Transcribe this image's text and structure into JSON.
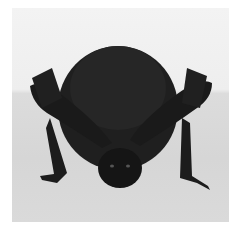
{
  "image": {
    "subject": "bat",
    "description": "Black-and-white photograph of a small dark furry bat facing the camera, perched on a light surface with wings folded and claws visible",
    "colors": {
      "border": "#ffffff",
      "background_upper": "#f0f0f0",
      "surface": "#d8d8d8",
      "fur": "#1e1e1e"
    }
  }
}
